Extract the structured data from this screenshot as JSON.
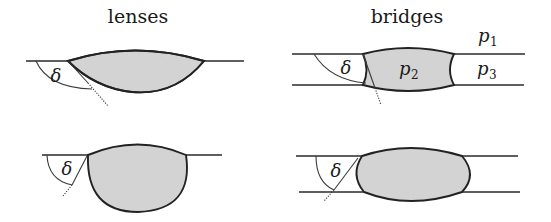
{
  "diagram": {
    "colors": {
      "fill": "#d6d6d6",
      "stroke": "#222222",
      "background": "#ffffff"
    },
    "columns": [
      {
        "title": "lenses"
      },
      {
        "title": "bridges"
      }
    ],
    "panels": [
      {
        "id": "lens-shallow",
        "angle_label": "δ"
      },
      {
        "id": "bridge-shallow",
        "angle_label": "δ",
        "phase_labels": [
          {
            "name": "p",
            "sub": "1"
          },
          {
            "name": "p",
            "sub": "2"
          },
          {
            "name": "p",
            "sub": "3"
          }
        ]
      },
      {
        "id": "lens-deep",
        "angle_label": "δ"
      },
      {
        "id": "bridge-deep",
        "angle_label": "δ"
      }
    ]
  }
}
